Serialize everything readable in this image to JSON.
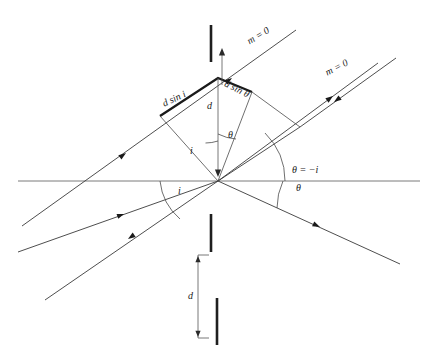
{
  "figure": {
    "domain": "Diagram",
    "background_color": "#ffffff",
    "ink_color": "#1a1a1a",
    "width": 434,
    "height": 361
  },
  "labels": {
    "order_upper": "m = 0",
    "order_right": "m = 0",
    "path_diff_incident": "d sin i",
    "path_diff_diffracted": "d sin θ",
    "spacing_upper": "d",
    "spacing_lower": "d",
    "angle_i_upper": "i",
    "angle_theta_upper": "θ",
    "angle_i_lower": "i",
    "angle_theta_eq": "θ = −i",
    "angle_theta_lower": "θ"
  },
  "caption": {
    "text": ""
  },
  "geometry": {
    "vertex": {
      "x": 218,
      "y": 181
    },
    "apex": {
      "x": 218,
      "y": 78
    },
    "horizontal_axis_y": 181,
    "axis_x_start": 18,
    "axis_x_end": 420
  }
}
